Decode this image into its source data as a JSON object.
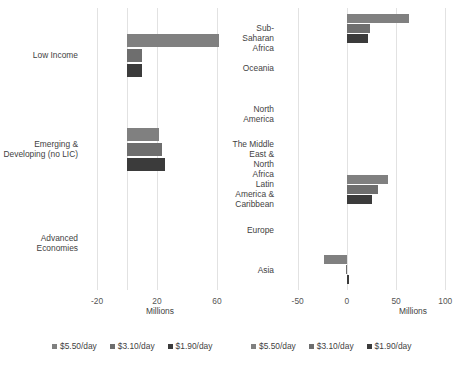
{
  "chart_data": [
    {
      "type": "bar",
      "orientation": "horizontal",
      "title": "",
      "xlabel": "Millions",
      "ylabel": "",
      "xlim": [
        -30,
        70
      ],
      "xticks": [
        -20,
        20,
        60
      ],
      "xticklabels": [
        "-20",
        "20",
        "60"
      ],
      "grid": true,
      "legend_position": "bottom",
      "categories": [
        "Low Income",
        "Emerging &\nDeveloping (no LIC)",
        "Advanced\nEconomies"
      ],
      "series": [
        {
          "name": "$5.50/day",
          "color": "#808080",
          "values": [
            61,
            21,
            0
          ]
        },
        {
          "name": "$3.10/day",
          "color": "#6e6e6e",
          "values": [
            10,
            23,
            0
          ]
        },
        {
          "name": "$1.90/day",
          "color": "#3b3b3b",
          "values": [
            10,
            25,
            0
          ]
        }
      ]
    },
    {
      "type": "bar",
      "orientation": "horizontal",
      "title": "",
      "xlabel": "Millions",
      "ylabel": "",
      "xlim": [
        -70,
        115
      ],
      "xticks": [
        -50,
        0,
        50,
        100
      ],
      "xticklabels": [
        "-50",
        "0",
        "50",
        "100"
      ],
      "grid": true,
      "legend_position": "bottom",
      "categories": [
        "Sub-Saharan Africa",
        "Oceania",
        "North America",
        "The Middle East &\nNorth Africa",
        "Latin America &\nCaribbean",
        "Europe",
        "Asia"
      ],
      "series": [
        {
          "name": "$5.50/day",
          "color": "#808080",
          "values": [
            63,
            0,
            0,
            0,
            42,
            0,
            -23
          ]
        },
        {
          "name": "$3.10/day",
          "color": "#6e6e6e",
          "values": [
            24,
            0,
            0,
            0,
            32,
            0,
            -1
          ]
        },
        {
          "name": "$1.90/day",
          "color": "#3b3b3b",
          "values": [
            21,
            0,
            0,
            0,
            26,
            0,
            2
          ]
        }
      ]
    }
  ],
  "legend": {
    "items": [
      {
        "label": "$5.50/day",
        "color": "#808080"
      },
      {
        "label": "$3.10/day",
        "color": "#6e6e6e"
      },
      {
        "label": "$1.90/day",
        "color": "#3b3b3b"
      }
    ]
  }
}
